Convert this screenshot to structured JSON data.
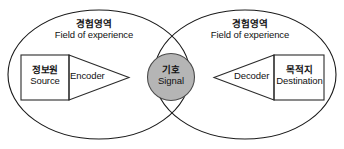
{
  "diagram": {
    "colors": {
      "background": "#ffffff",
      "outline": "#1a1a1a",
      "box_outline": "#2b2b2b",
      "signal_fill": "#b5b5b5",
      "signal_outline": "#4a4a4a",
      "text": "#111111"
    },
    "fields_of_experience": [
      {
        "id": "left",
        "korean": "경험영역",
        "english": "Field of experience"
      },
      {
        "id": "right",
        "korean": "경험영역",
        "english": "Field of experience"
      }
    ],
    "nodes": [
      {
        "id": "source",
        "shape": "rectangle",
        "korean": "정보원",
        "english": "Source"
      },
      {
        "id": "encoder",
        "shape": "triangle-right",
        "korean": "",
        "english": "Encoder"
      },
      {
        "id": "signal",
        "shape": "circle",
        "korean": "기호",
        "english": "Signal"
      },
      {
        "id": "decoder",
        "shape": "triangle-left",
        "korean": "",
        "english": "Decoder"
      },
      {
        "id": "destination",
        "shape": "rectangle",
        "korean": "목적지",
        "english": "Destination"
      }
    ]
  }
}
